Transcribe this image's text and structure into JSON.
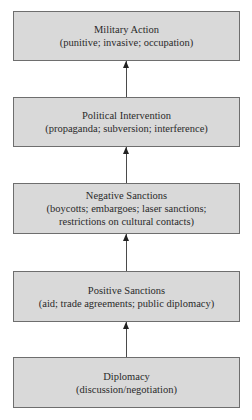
{
  "diagram": {
    "type": "escalation-ladder",
    "direction": "bottom-to-top",
    "colors": {
      "box_fill": "#d9d9d9",
      "box_border": "#6e6e6e",
      "arrow": "#4a4a4a",
      "text": "#2a2a2a"
    },
    "levels": [
      {
        "title": "Military Action",
        "detail_lines": [
          "(punitive; invasive; occupation)"
        ]
      },
      {
        "title": "Political Intervention",
        "detail_lines": [
          "(propaganda; subversion; interference)"
        ]
      },
      {
        "title": "Negative Sanctions",
        "detail_lines": [
          "(boycotts; embargoes; laser sanctions;",
          "restrictions on cultural contacts)"
        ]
      },
      {
        "title": "Positive Sanctions",
        "detail_lines": [
          "(aid; trade agreements; public diplomacy)"
        ]
      },
      {
        "title": "Diplomacy",
        "detail_lines": [
          "(discussion/negotiation)"
        ]
      }
    ],
    "arrows": [
      {
        "from": "Political Intervention",
        "to": "Military Action"
      },
      {
        "from": "Negative Sanctions",
        "to": "Political Intervention"
      },
      {
        "from": "Positive Sanctions",
        "to": "Negative Sanctions"
      },
      {
        "from": "Diplomacy",
        "to": "Positive Sanctions"
      }
    ]
  }
}
